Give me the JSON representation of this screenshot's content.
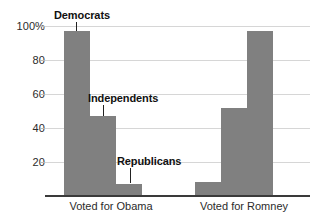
{
  "chart_data": {
    "type": "bar",
    "title": "",
    "subtitle": "",
    "xlabel": "",
    "ylabel": "",
    "ylim": [
      0,
      100
    ],
    "grid": true,
    "legend_position": "annotations-inline",
    "categories": [
      "Voted for Obama",
      "Voted for Romney"
    ],
    "y_ticks": [
      {
        "label": "100%",
        "value": 100
      },
      {
        "label": "80",
        "value": 80
      },
      {
        "label": "60",
        "value": 60
      },
      {
        "label": "40",
        "value": 40
      },
      {
        "label": "20",
        "value": 20
      }
    ],
    "series": [
      {
        "name": "Democrats",
        "values": [
          97,
          8
        ]
      },
      {
        "name": "Independents",
        "values": [
          47,
          52
        ]
      },
      {
        "name": "Republicans",
        "values": [
          7,
          97
        ]
      }
    ],
    "annotations": [
      {
        "text": "Democrats",
        "points_to": "Voted for Obama / Democrats"
      },
      {
        "text": "Independents",
        "points_to": "Voted for Obama / Independents"
      },
      {
        "text": "Republicans",
        "points_to": "Voted for Obama / Republicans"
      }
    ],
    "colors": {
      "bar": "#808080",
      "gridline": "#d6d6d6",
      "axis": "#3a3a3a",
      "tick_text": "#2b2b2b",
      "annotation_text": "#111111",
      "background": "#ffffff"
    }
  }
}
